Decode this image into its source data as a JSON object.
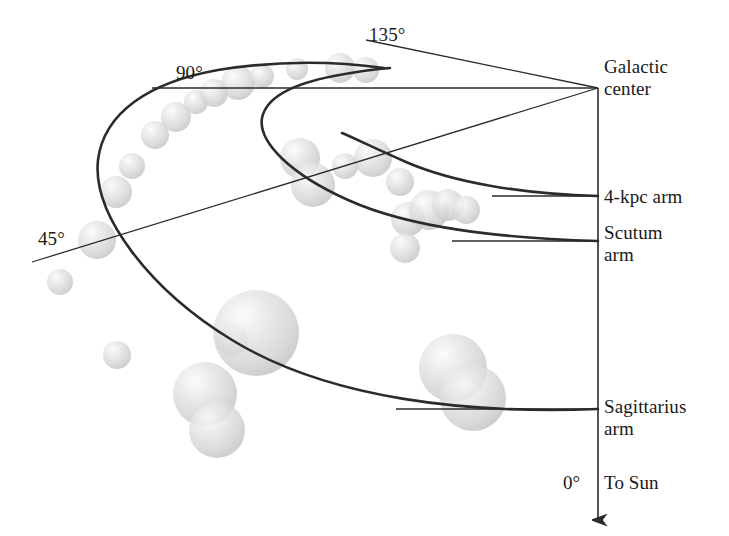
{
  "figure": {
    "type": "astronomy-schematic",
    "title_visible": false,
    "background_color": "#ffffff",
    "line_color": "#2b2b2b",
    "cloud_fill_color": "#d5d5d5",
    "cloud_highlight_color": "#f2f2f2",
    "text_color": "#1a1a1a"
  },
  "labels": {
    "galactic_center": "Galactic\ncenter",
    "arm_4kpc": "4-kpc arm",
    "arm_scutum": "Scutum\narm",
    "arm_sagittarius": "Sagittarius\narm",
    "to_sun": "To Sun",
    "angle_0": "0°",
    "angle_45": "45°",
    "angle_90": "90°",
    "angle_135": "135°"
  },
  "chart_data": {
    "type": "scatter",
    "xlabel": "",
    "ylabel": "",
    "legend_position": "none",
    "grid": false,
    "galactic_center_point": {
      "x": 598,
      "y": 88
    },
    "sun_direction_degrees": 0,
    "angle_reference_lines": [
      {
        "label": "0°",
        "from": {
          "x": 598,
          "y": 88
        },
        "to": {
          "x": 598,
          "y": 520
        },
        "arrow": true
      },
      {
        "label": "45°",
        "from": {
          "x": 598,
          "y": 88
        },
        "to": {
          "x": 32,
          "y": 262
        },
        "arrow": false
      },
      {
        "label": "90°",
        "from": {
          "x": 598,
          "y": 88
        },
        "to": {
          "x": 152,
          "y": 88
        },
        "arrow": false
      },
      {
        "label": "135°",
        "from": {
          "x": 598,
          "y": 88
        },
        "to": {
          "x": 366,
          "y": 40
        },
        "arrow": false
      }
    ],
    "arms": [
      {
        "name": "Sagittarius arm",
        "label_anchor": {
          "x": 604,
          "y": 405
        },
        "tick_line": {
          "from": {
            "x": 396,
            "y": 409
          },
          "to": {
            "x": 598,
            "y": 409
          }
        },
        "path": "M 598 409 C 470 414 330 400 232 340 C 150 290 92 215 98 160 C 104 112 150 82 218 70 C 280 60 340 62 384 68"
      },
      {
        "name": "Scutum arm",
        "label_anchor": {
          "x": 604,
          "y": 231
        },
        "tick_line": {
          "from": {
            "x": 452,
            "y": 241
          },
          "to": {
            "x": 598,
            "y": 241
          }
        },
        "path": "M 598 241 C 500 238 410 228 348 200 C 290 174 258 142 262 118 C 266 98 292 84 334 76 C 360 71 378 69 390 68"
      },
      {
        "name": "4-kpc arm",
        "label_anchor": {
          "x": 604,
          "y": 186
        },
        "tick_line": {
          "from": {
            "x": 492,
            "y": 196
          },
          "to": {
            "x": 598,
            "y": 196
          }
        },
        "path": "M 598 196 C 520 194 452 182 406 162 C 372 147 352 137 342 133"
      }
    ],
    "molecular_clouds": [
      {
        "x": 60,
        "y": 282,
        "r": 13
      },
      {
        "x": 97,
        "y": 240,
        "r": 19
      },
      {
        "x": 116,
        "y": 192,
        "r": 16
      },
      {
        "x": 132,
        "y": 166,
        "r": 13
      },
      {
        "x": 155,
        "y": 135,
        "r": 14
      },
      {
        "x": 176,
        "y": 117,
        "r": 15
      },
      {
        "x": 196,
        "y": 102,
        "r": 12
      },
      {
        "x": 214,
        "y": 93,
        "r": 14
      },
      {
        "x": 238,
        "y": 83,
        "r": 17
      },
      {
        "x": 262,
        "y": 76,
        "r": 12
      },
      {
        "x": 297,
        "y": 69,
        "r": 11
      },
      {
        "x": 340,
        "y": 68,
        "r": 15
      },
      {
        "x": 366,
        "y": 70,
        "r": 13
      },
      {
        "x": 117,
        "y": 355,
        "r": 14
      },
      {
        "x": 232,
        "y": 340,
        "r": 16
      },
      {
        "x": 256,
        "y": 333,
        "r": 43
      },
      {
        "x": 205,
        "y": 394,
        "r": 32
      },
      {
        "x": 217,
        "y": 430,
        "r": 28
      },
      {
        "x": 300,
        "y": 158,
        "r": 20
      },
      {
        "x": 313,
        "y": 185,
        "r": 22
      },
      {
        "x": 345,
        "y": 166,
        "r": 13
      },
      {
        "x": 373,
        "y": 158,
        "r": 19
      },
      {
        "x": 400,
        "y": 182,
        "r": 14
      },
      {
        "x": 408,
        "y": 219,
        "r": 17
      },
      {
        "x": 429,
        "y": 210,
        "r": 20
      },
      {
        "x": 448,
        "y": 205,
        "r": 16
      },
      {
        "x": 466,
        "y": 210,
        "r": 14
      },
      {
        "x": 405,
        "y": 248,
        "r": 15
      },
      {
        "x": 453,
        "y": 368,
        "r": 34
      },
      {
        "x": 473,
        "y": 398,
        "r": 33
      }
    ]
  }
}
